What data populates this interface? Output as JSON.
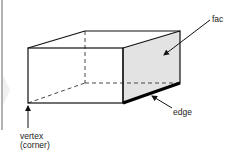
{
  "diagram": {
    "labels": {
      "face": "fac",
      "edge": "edge",
      "vertex_line1": "vertex",
      "vertex_line2": "(corner)"
    },
    "colors": {
      "stroke": "#111111",
      "face_fill": "#e3e3e3",
      "divider": "#555555",
      "chevron": "#f0f0f0"
    }
  }
}
